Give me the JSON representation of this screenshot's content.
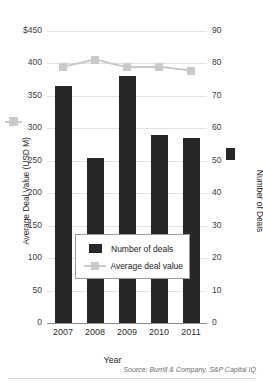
{
  "chart_data": {
    "type": "bar",
    "title": "",
    "subtitle": "",
    "xlabel": "Year",
    "ylabel": "Average Deal Value (USD M)",
    "y2label": "Number of Deals",
    "categories": [
      "2007",
      "2008",
      "2009",
      "2010",
      "2011"
    ],
    "grid": true,
    "legend_position": "inside-bottom-center",
    "ylim": [
      0,
      450
    ],
    "yticks": [
      0,
      50,
      100,
      150,
      200,
      250,
      300,
      350,
      400,
      450
    ],
    "ytick_labels": [
      "0",
      "50",
      "100",
      "150",
      "200",
      "250",
      "300",
      "350",
      "400",
      "$450"
    ],
    "y2lim": [
      0,
      90
    ],
    "y2ticks": [
      0,
      10,
      20,
      30,
      40,
      50,
      60,
      70,
      80,
      90
    ],
    "y2tick_labels": [
      "0",
      "10",
      "20",
      "30",
      "40",
      "50",
      "60",
      "70",
      "80",
      "90"
    ],
    "series": [
      {
        "name": "Number of deals",
        "type": "bar",
        "axis": "right",
        "color": "#272727",
        "values": [
          73,
          51,
          76,
          58,
          57
        ]
      },
      {
        "name": "Average deal value",
        "type": "line",
        "axis": "left",
        "color": "#c9c9c9",
        "values": [
          395,
          406,
          394,
          395,
          389
        ]
      }
    ]
  },
  "legend": {
    "items": [
      {
        "label": "Number of deals",
        "marker": "square-filled-dark"
      },
      {
        "label": "Average deal value",
        "marker": "line-square-gray"
      }
    ]
  },
  "source": {
    "text": "Source: Burrill & Company, S&P Capital IQ"
  },
  "icons": {
    "left_axis_glyph": "gray-line-marker-icon",
    "right_axis_glyph": "dark-bar-swatch-icon"
  }
}
